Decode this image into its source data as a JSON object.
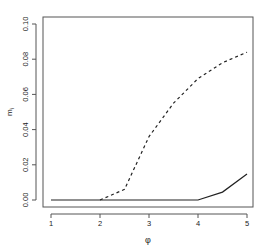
{
  "chart_data": {
    "type": "line",
    "title": "",
    "xlabel": "φ",
    "ylabel": "m_i",
    "xlim": [
      0.88,
      5.12
    ],
    "ylim": [
      -0.004,
      0.104
    ],
    "x_ticks": [
      1,
      2,
      3,
      4,
      5
    ],
    "x_tick_labels": [
      "1",
      "2",
      "3",
      "4",
      "5"
    ],
    "y_ticks": [
      0.0,
      0.02,
      0.04,
      0.06,
      0.08,
      0.1
    ],
    "y_tick_labels": [
      "0.00",
      "0.02",
      "0.04",
      "0.06",
      "0.08",
      "0.10"
    ],
    "grid": false,
    "legend": null,
    "x": [
      1,
      1.5,
      2,
      2.5,
      3,
      3.5,
      4,
      4.5,
      5
    ],
    "series": [
      {
        "name": "solid",
        "style": "solid",
        "color": "#222222",
        "values": [
          0.0,
          0.0,
          0.0,
          0.0,
          0.0,
          0.0,
          0.0,
          0.0045,
          0.0148
        ]
      },
      {
        "name": "dashed",
        "style": "dashed",
        "color": "#222222",
        "values": [
          null,
          null,
          0.0,
          0.006,
          0.036,
          0.055,
          0.069,
          0.078,
          0.084
        ]
      }
    ]
  }
}
